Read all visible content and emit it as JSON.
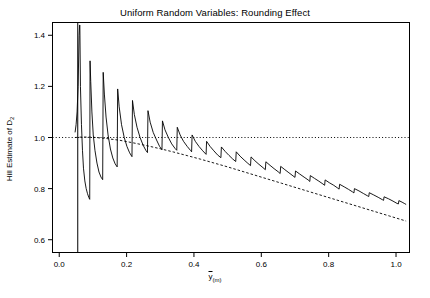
{
  "chart_data": {
    "type": "line",
    "title": "Uniform Random Variables: Rounding Effect",
    "xlabel": "y(m)",
    "xlabel_parts": {
      "main": "y",
      "sub": "(m)"
    },
    "ylabel": "Hill Estimate of D2",
    "ylabel_parts": {
      "main": "Hill Estimate of D",
      "sub": "2"
    },
    "xlim": [
      -0.02,
      1.04
    ],
    "ylim": [
      0.55,
      1.45
    ],
    "xticks": [
      0.0,
      0.2,
      0.4,
      0.6,
      0.8,
      1.0
    ],
    "xtick_labels": [
      "0.0",
      "0.2",
      "0.4",
      "0.6",
      "0.8",
      "1.0"
    ],
    "yticks": [
      0.6,
      0.8,
      1.0,
      1.2,
      1.4
    ],
    "ytick_labels": [
      "0.6",
      "0.8",
      "1.0",
      "1.2",
      "1.4"
    ],
    "grid": false,
    "legend": null,
    "reference_lines": [
      {
        "name": "horizontal-dotted-unity",
        "orientation": "horizontal",
        "value": 1.0,
        "style": "dotted"
      },
      {
        "name": "vertical-solid-cutoff",
        "orientation": "vertical",
        "value": 0.055,
        "style": "solid"
      }
    ],
    "series": [
      {
        "name": "hill-estimate-sawtooth",
        "style": "solid",
        "points": [
          [
            0.047,
            1.02
          ],
          [
            0.05,
            1.05
          ],
          [
            0.053,
            1.1
          ],
          [
            0.056,
            1.2
          ],
          [
            0.059,
            1.4
          ],
          [
            0.0605,
            1.44
          ],
          [
            0.0612,
            1.44
          ],
          [
            0.063,
            1.2
          ],
          [
            0.066,
            1.05
          ],
          [
            0.069,
            0.95
          ],
          [
            0.072,
            0.88
          ],
          [
            0.076,
            0.83
          ],
          [
            0.08,
            0.8
          ],
          [
            0.084,
            0.78
          ],
          [
            0.088,
            0.765
          ],
          [
            0.0905,
            0.758
          ],
          [
            0.0915,
            1.3
          ],
          [
            0.0935,
            1.22
          ],
          [
            0.097,
            1.1
          ],
          [
            0.101,
            1.01
          ],
          [
            0.106,
            0.95
          ],
          [
            0.112,
            0.9
          ],
          [
            0.118,
            0.865
          ],
          [
            0.124,
            0.845
          ],
          [
            0.129,
            0.835
          ],
          [
            0.1305,
            1.255
          ],
          [
            0.134,
            1.17
          ],
          [
            0.139,
            1.08
          ],
          [
            0.145,
            1.01
          ],
          [
            0.152,
            0.955
          ],
          [
            0.159,
            0.92
          ],
          [
            0.166,
            0.897
          ],
          [
            0.172,
            0.885
          ],
          [
            0.1735,
            1.19
          ],
          [
            0.178,
            1.12
          ],
          [
            0.185,
            1.05
          ],
          [
            0.193,
            1.0
          ],
          [
            0.201,
            0.965
          ],
          [
            0.209,
            0.94
          ],
          [
            0.216,
            0.925
          ],
          [
            0.2175,
            1.145
          ],
          [
            0.223,
            1.09
          ],
          [
            0.231,
            1.04
          ],
          [
            0.24,
            1.0
          ],
          [
            0.249,
            0.97
          ],
          [
            0.257,
            0.95
          ],
          [
            0.262,
            0.941
          ],
          [
            0.2635,
            1.105
          ],
          [
            0.27,
            1.06
          ],
          [
            0.279,
            1.02
          ],
          [
            0.289,
            0.99
          ],
          [
            0.298,
            0.965
          ],
          [
            0.305,
            0.952
          ],
          [
            0.3065,
            1.065
          ],
          [
            0.314,
            1.03
          ],
          [
            0.324,
            1.0
          ],
          [
            0.334,
            0.975
          ],
          [
            0.344,
            0.957
          ],
          [
            0.349,
            0.95
          ],
          [
            0.3505,
            1.04
          ],
          [
            0.359,
            1.01
          ],
          [
            0.369,
            0.985
          ],
          [
            0.38,
            0.965
          ],
          [
            0.39,
            0.949
          ],
          [
            0.393,
            0.944
          ],
          [
            0.3945,
            1.01
          ],
          [
            0.404,
            0.985
          ],
          [
            0.415,
            0.965
          ],
          [
            0.426,
            0.948
          ],
          [
            0.436,
            0.934
          ],
          [
            0.4375,
            0.985
          ],
          [
            0.448,
            0.965
          ],
          [
            0.459,
            0.948
          ],
          [
            0.47,
            0.932
          ],
          [
            0.48,
            0.921
          ],
          [
            0.4815,
            0.963
          ],
          [
            0.493,
            0.945
          ],
          [
            0.504,
            0.93
          ],
          [
            0.515,
            0.916
          ],
          [
            0.524,
            0.906
          ],
          [
            0.5255,
            0.944
          ],
          [
            0.537,
            0.927
          ],
          [
            0.549,
            0.912
          ],
          [
            0.56,
            0.899
          ],
          [
            0.568,
            0.89
          ],
          [
            0.5695,
            0.924
          ],
          [
            0.581,
            0.909
          ],
          [
            0.593,
            0.895
          ],
          [
            0.605,
            0.882
          ],
          [
            0.612,
            0.874
          ],
          [
            0.6135,
            0.905
          ],
          [
            0.626,
            0.891
          ],
          [
            0.638,
            0.878
          ],
          [
            0.65,
            0.866
          ],
          [
            0.656,
            0.859
          ],
          [
            0.6575,
            0.887
          ],
          [
            0.67,
            0.874
          ],
          [
            0.682,
            0.862
          ],
          [
            0.694,
            0.85
          ],
          [
            0.7,
            0.844
          ],
          [
            0.7015,
            0.869
          ],
          [
            0.714,
            0.857
          ],
          [
            0.727,
            0.845
          ],
          [
            0.739,
            0.834
          ],
          [
            0.744,
            0.828
          ],
          [
            0.7455,
            0.851
          ],
          [
            0.758,
            0.84
          ],
          [
            0.771,
            0.829
          ],
          [
            0.783,
            0.818
          ],
          [
            0.788,
            0.813
          ],
          [
            0.7895,
            0.834
          ],
          [
            0.802,
            0.823
          ],
          [
            0.815,
            0.813
          ],
          [
            0.827,
            0.802
          ],
          [
            0.831,
            0.798
          ],
          [
            0.8325,
            0.817
          ],
          [
            0.846,
            0.807
          ],
          [
            0.859,
            0.797
          ],
          [
            0.871,
            0.787
          ],
          [
            0.875,
            0.783
          ],
          [
            0.8765,
            0.8
          ],
          [
            0.89,
            0.791
          ],
          [
            0.903,
            0.781
          ],
          [
            0.915,
            0.772
          ],
          [
            0.919,
            0.769
          ],
          [
            0.9205,
            0.784
          ],
          [
            0.934,
            0.775
          ],
          [
            0.947,
            0.766
          ],
          [
            0.959,
            0.757
          ],
          [
            0.963,
            0.754
          ],
          [
            0.9645,
            0.768
          ],
          [
            0.978,
            0.76
          ],
          [
            0.991,
            0.751
          ],
          [
            1.003,
            0.742
          ],
          [
            1.007,
            0.74
          ],
          [
            1.0085,
            0.753
          ],
          [
            1.018,
            0.747
          ],
          [
            1.026,
            0.741
          ],
          [
            1.03,
            0.738
          ]
        ]
      },
      {
        "name": "smooth-dashed-reference",
        "style": "dashed",
        "points": [
          [
            0.047,
            1.0
          ],
          [
            0.07,
            1.002
          ],
          [
            0.1,
            1.001
          ],
          [
            0.14,
            0.996
          ],
          [
            0.18,
            0.989
          ],
          [
            0.22,
            0.979
          ],
          [
            0.26,
            0.968
          ],
          [
            0.3,
            0.956
          ],
          [
            0.34,
            0.943
          ],
          [
            0.38,
            0.929
          ],
          [
            0.42,
            0.915
          ],
          [
            0.46,
            0.9
          ],
          [
            0.5,
            0.885
          ],
          [
            0.54,
            0.869
          ],
          [
            0.58,
            0.853
          ],
          [
            0.62,
            0.837
          ],
          [
            0.66,
            0.821
          ],
          [
            0.7,
            0.805
          ],
          [
            0.74,
            0.789
          ],
          [
            0.78,
            0.773
          ],
          [
            0.82,
            0.757
          ],
          [
            0.86,
            0.741
          ],
          [
            0.9,
            0.725
          ],
          [
            0.94,
            0.709
          ],
          [
            0.98,
            0.693
          ],
          [
            1.01,
            0.681
          ],
          [
            1.03,
            0.673
          ]
        ]
      }
    ]
  }
}
